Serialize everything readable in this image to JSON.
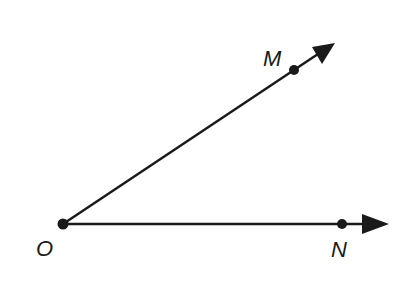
{
  "diagram": {
    "type": "angle",
    "vertex": {
      "label": "O",
      "x": 63,
      "y": 224
    },
    "rays": [
      {
        "name": "ray-OM",
        "from": "O",
        "through": "M",
        "point": {
          "label": "M",
          "x": 294,
          "y": 70
        },
        "tip": {
          "x": 335,
          "y": 43
        }
      },
      {
        "name": "ray-ON",
        "from": "O",
        "through": "N",
        "point": {
          "label": "N",
          "x": 342,
          "y": 224
        },
        "tip": {
          "x": 389,
          "y": 224
        }
      }
    ],
    "labels": {
      "O": "O",
      "M": "M",
      "N": "N"
    },
    "colors": {
      "stroke": "#1a1a1a",
      "background": "#ffffff"
    }
  }
}
